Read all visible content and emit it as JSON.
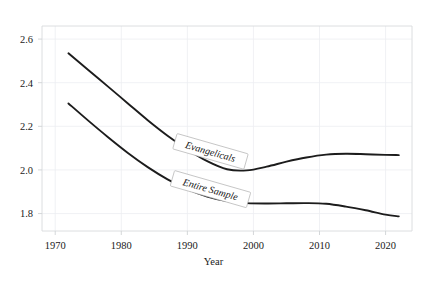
{
  "chart_data": {
    "type": "line",
    "title": "",
    "xlabel": "Year",
    "ylabel": "",
    "xlim": [
      1968,
      2024
    ],
    "ylim": [
      1.72,
      2.66
    ],
    "grid": true,
    "legend_position": "inline-labels",
    "xticks": [
      "1970",
      "1980",
      "1990",
      "2000",
      "2010",
      "2020"
    ],
    "xtick_values": [
      1970,
      1980,
      1990,
      2000,
      2010,
      2020
    ],
    "yticks": [
      "1.8",
      "2.0",
      "2.2",
      "2.4",
      "2.6"
    ],
    "ytick_values": [
      1.8,
      2.0,
      2.2,
      2.4,
      2.6
    ],
    "series": [
      {
        "name": "Evangelicals",
        "color": "#1c1c1c",
        "label_x": 1993.5,
        "label_y": 2.085,
        "label_rotation": 16,
        "x": [
          1972,
          1975,
          1978,
          1981,
          1984,
          1987,
          1990,
          1993,
          1996,
          1999,
          2002,
          2005,
          2008,
          2011,
          2014,
          2017,
          2020,
          2022
        ],
        "values": [
          2.535,
          2.458,
          2.382,
          2.305,
          2.228,
          2.157,
          2.094,
          2.04,
          2.003,
          1.998,
          2.015,
          2.038,
          2.057,
          2.07,
          2.074,
          2.072,
          2.069,
          2.068
        ]
      },
      {
        "name": "Entire Sample",
        "color": "#1c1c1c",
        "label_x": 1993.5,
        "label_y": 1.912,
        "label_rotation": 16,
        "x": [
          1972,
          1975,
          1978,
          1981,
          1984,
          1987,
          1990,
          1993,
          1996,
          1999,
          2002,
          2005,
          2008,
          2011,
          2014,
          2017,
          2020,
          2022
        ],
        "values": [
          2.305,
          2.226,
          2.15,
          2.078,
          2.013,
          1.957,
          1.912,
          1.878,
          1.857,
          1.848,
          1.846,
          1.847,
          1.848,
          1.845,
          1.832,
          1.815,
          1.795,
          1.787
        ]
      }
    ]
  }
}
